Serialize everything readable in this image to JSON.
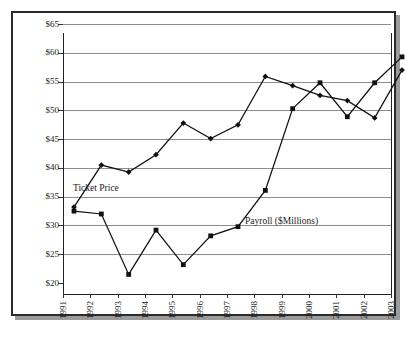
{
  "chart_data": {
    "type": "line",
    "title": "",
    "xlabel": "",
    "ylabel": "",
    "x": [
      1991,
      1992,
      1993,
      1994,
      1995,
      1996,
      1997,
      1998,
      1999,
      2000,
      2001,
      2002,
      2003
    ],
    "categories": [
      "1991",
      "1992",
      "1993",
      "1994",
      "1995",
      "1996",
      "1997",
      "1998",
      "1999",
      "2000",
      "2001",
      "2002",
      "2003"
    ],
    "ylim": [
      20,
      65
    ],
    "yticks": [
      20,
      25,
      30,
      35,
      40,
      45,
      50,
      55,
      60,
      65
    ],
    "ytick_labels": [
      "$20",
      "$25",
      "$30",
      "$35",
      "$40",
      "$45",
      "$50",
      "$55",
      "$60",
      "$65"
    ],
    "grid": true,
    "legend_position": "inline-annotation",
    "series": [
      {
        "name": "Ticket Price",
        "marker": "diamond",
        "values": [
          35.1,
          42.4,
          41.2,
          44.2,
          49.7,
          47.0,
          49.4,
          57.8,
          56.2,
          54.5,
          53.6,
          50.6,
          58.9
        ]
      },
      {
        "name": "Payroll ($Millions)",
        "marker": "square",
        "values": [
          34.4,
          33.9,
          23.4,
          31.1,
          25.1,
          30.1,
          31.7,
          38.0,
          52.2,
          56.7,
          50.8,
          56.7,
          61.2
        ]
      }
    ],
    "annotations": [
      {
        "text": "Ticket Price",
        "x": 1991.4,
        "y": 39.2
      },
      {
        "text": "Payroll ($Millions)",
        "x": 1997.8,
        "y": 33.4
      }
    ]
  },
  "colors": {
    "line": "#111111",
    "grid": "#8d8d8d",
    "axis": "#222222",
    "frame": "#2a2a2a",
    "shadow": "#9b9b9b",
    "background": "#ffffff",
    "text": "#242424"
  }
}
